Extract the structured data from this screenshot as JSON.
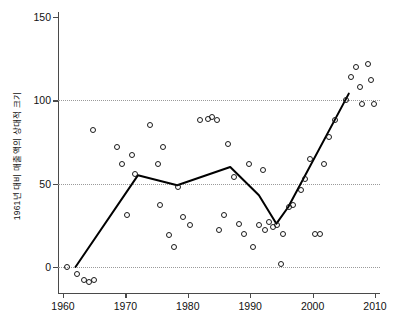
{
  "chart_data": {
    "type": "scatter",
    "title": "",
    "subtitle": "",
    "xlabel": "",
    "ylabel": "1961년 대비 매출액의 상대적 크기",
    "xlim": [
      1958,
      2012
    ],
    "ylim": [
      -18,
      155
    ],
    "xticks": [
      1960,
      1970,
      1980,
      1990,
      2000,
      2010
    ],
    "yticks": [
      0,
      50,
      100,
      150
    ],
    "gridlines": {
      "y": [
        0,
        50,
        100
      ],
      "style": "dotted",
      "x": []
    },
    "legend": null,
    "marker": "open-circle",
    "series": [
      {
        "name": "관측값",
        "type": "scatter",
        "points": [
          [
            1960.6,
            0
          ],
          [
            1962.2,
            -4
          ],
          [
            1963.3,
            -8
          ],
          [
            1964.2,
            -9
          ],
          [
            1964.8,
            82
          ],
          [
            1965.0,
            -8
          ],
          [
            1968.6,
            72
          ],
          [
            1969.5,
            62
          ],
          [
            1970.2,
            31
          ],
          [
            1971.0,
            67
          ],
          [
            1971.6,
            56
          ],
          [
            1974.0,
            85
          ],
          [
            1975.2,
            62
          ],
          [
            1975.6,
            37
          ],
          [
            1976.0,
            72
          ],
          [
            1977.0,
            19
          ],
          [
            1977.8,
            12
          ],
          [
            1978.4,
            48
          ],
          [
            1979.2,
            30
          ],
          [
            1980.4,
            25
          ],
          [
            1982.0,
            88
          ],
          [
            1983.2,
            89
          ],
          [
            1983.9,
            90
          ],
          [
            1984.6,
            88
          ],
          [
            1985.0,
            22
          ],
          [
            1985.8,
            31
          ],
          [
            1986.4,
            74
          ],
          [
            1987.4,
            54
          ],
          [
            1988.2,
            26
          ],
          [
            1989.0,
            20
          ],
          [
            1989.8,
            62
          ],
          [
            1990.4,
            12
          ],
          [
            1991.4,
            25
          ],
          [
            1992.0,
            58
          ],
          [
            1992.4,
            22
          ],
          [
            1993.0,
            27
          ],
          [
            1993.6,
            24
          ],
          [
            1994.3,
            25
          ],
          [
            1994.9,
            2
          ],
          [
            1995.2,
            20
          ],
          [
            1996.2,
            36
          ],
          [
            1996.9,
            37
          ],
          [
            1998.2,
            46
          ],
          [
            1998.8,
            53
          ],
          [
            1999.6,
            65
          ],
          [
            2000.4,
            20
          ],
          [
            2001.2,
            20
          ],
          [
            2001.8,
            62
          ],
          [
            2002.6,
            78
          ],
          [
            2003.6,
            88
          ],
          [
            2005.4,
            100
          ],
          [
            2006.2,
            114
          ],
          [
            2007.0,
            120
          ],
          [
            2007.6,
            108
          ],
          [
            2007.9,
            98
          ],
          [
            2008.8,
            122
          ],
          [
            2009.4,
            112
          ],
          [
            2009.9,
            98
          ]
        ]
      },
      {
        "name": "추세선",
        "type": "line",
        "points": [
          [
            1962.0,
            0
          ],
          [
            1972.0,
            55
          ],
          [
            1978.3,
            49
          ],
          [
            1986.8,
            60
          ],
          [
            1991.4,
            43
          ],
          [
            1994.2,
            26
          ],
          [
            1996.1,
            36
          ],
          [
            2005.8,
            104
          ]
        ]
      }
    ]
  },
  "colors": {
    "axis": "#4a4a4a",
    "marker_stroke": "#1a1a1a",
    "trend_line": "#000000",
    "gridline": "#9a9a9a",
    "background": "#ffffff"
  }
}
